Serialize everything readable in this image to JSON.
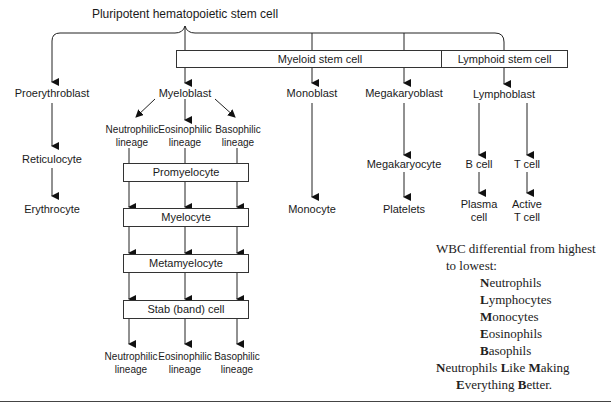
{
  "title": "Pluripotent hematopoietic stem cell",
  "boxes": {
    "myeloid": "Myeloid stem cell",
    "lymphoid": "Lymphoid stem cell",
    "promyelocyte": "Promyelocyte",
    "myelocyte": "Myelocyte",
    "metamyelocyte": "Metamyelocyte",
    "stab": "Stab (band) cell"
  },
  "erythroid": [
    "Proerythroblast",
    "Reticulocyte",
    "Erythrocyte"
  ],
  "myeloblast": "Myeloblast",
  "lineages_top": [
    {
      "line1": "Neutrophilic",
      "line2": "lineage"
    },
    {
      "line1": "Eosinophilic",
      "line2": "lineage"
    },
    {
      "line1": "Basophilic",
      "line2": "lineage"
    }
  ],
  "lineages_bottom": [
    {
      "line1": "Neutrophilic",
      "line2": "lineage"
    },
    {
      "line1": "Eosinophilic",
      "line2": "lineage"
    },
    {
      "line1": "Basophilic",
      "line2": "lineage"
    }
  ],
  "monocytic": [
    "Monoblast",
    "Monocyte"
  ],
  "megakaryocytic": [
    "Megakaryoblast",
    "Megakaryocyte",
    "Platelets"
  ],
  "lymphoid": {
    "lymphoblast": "Lymphoblast",
    "b_cell": "B cell",
    "t_cell": "T cell",
    "plasma": {
      "line1": "Plasma",
      "line2": "cell"
    },
    "active_t": {
      "line1": "Active",
      "line2": "T cell"
    }
  },
  "note": {
    "heading1": "WBC differential from highest",
    "heading2": "to lowest:",
    "items": [
      {
        "initial": "N",
        "rest": "eutrophils"
      },
      {
        "initial": "L",
        "rest": "ymphocytes"
      },
      {
        "initial": "M",
        "rest": "onocytes"
      },
      {
        "initial": "E",
        "rest": "osinophils"
      },
      {
        "initial": "B",
        "rest": "asophils"
      }
    ],
    "mnemonic1": [
      {
        "initial": "N",
        "rest": "eutrophils "
      },
      {
        "initial": "L",
        "rest": "ike "
      },
      {
        "initial": "M",
        "rest": "aking"
      }
    ],
    "mnemonic2": [
      {
        "initial": "E",
        "rest": "verything "
      },
      {
        "initial": "B",
        "rest": "etter."
      }
    ]
  }
}
